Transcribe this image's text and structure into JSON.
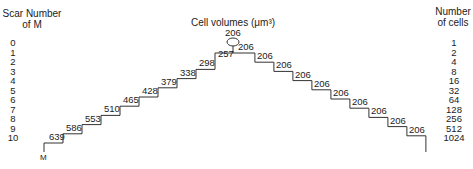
{
  "left_header": {
    "line1": "Scar Number",
    "line2": "of M"
  },
  "right_header": {
    "line1": "Number",
    "line2": "of cells"
  },
  "title": "Cell volumes (μm³)",
  "scar_numbers": [
    "0",
    "1",
    "2",
    "3",
    "4",
    "5",
    "6",
    "7",
    "8",
    "9",
    "10"
  ],
  "cell_counts": [
    "1",
    "2",
    "4",
    "8",
    "16",
    "32",
    "64",
    "128",
    "256",
    "512",
    "1024"
  ],
  "mother_label": "M",
  "apex_volume": "206",
  "left_steps": [
    "639",
    "586",
    "553",
    "510",
    "465",
    "428",
    "379",
    "338",
    "298",
    "257"
  ],
  "right_steps": [
    "206",
    "206",
    "206",
    "206",
    "206",
    "206",
    "206",
    "206",
    "206",
    "206"
  ],
  "chart_data": {
    "type": "diagram",
    "title": "Cell volumes (μm³)",
    "mother_lineage_by_scar_number": {
      "scars": [
        10,
        9,
        8,
        7,
        6,
        5,
        4,
        3,
        2,
        1
      ],
      "volumes": [
        639,
        586,
        553,
        510,
        465,
        428,
        379,
        338,
        298,
        257
      ]
    },
    "daughter_volumes": [
      206,
      206,
      206,
      206,
      206,
      206,
      206,
      206,
      206,
      206
    ],
    "apex_bud_volume": 206,
    "scar_number_axis": [
      0,
      1,
      2,
      3,
      4,
      5,
      6,
      7,
      8,
      9,
      10
    ],
    "number_of_cells_axis": [
      1,
      2,
      4,
      8,
      16,
      32,
      64,
      128,
      256,
      512,
      1024
    ]
  }
}
